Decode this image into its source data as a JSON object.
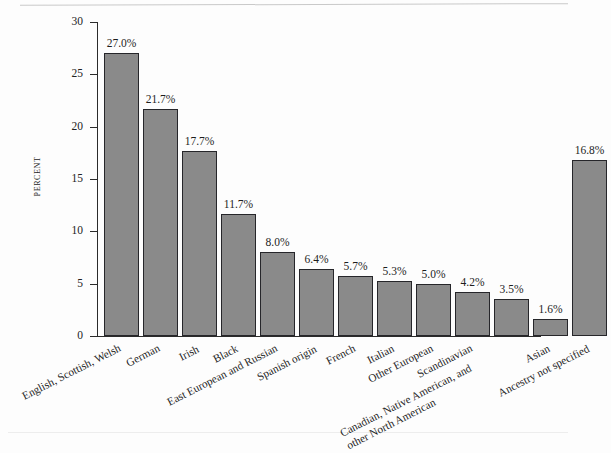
{
  "chart_data": {
    "type": "bar",
    "title": "",
    "xlabel": "",
    "ylabel": "PERCENT",
    "ylim": [
      0,
      30
    ],
    "yticks": [
      0,
      5,
      10,
      15,
      20,
      25,
      30
    ],
    "ytick_labels": [
      "0",
      "5",
      "10",
      "15",
      "20",
      "25",
      "30"
    ],
    "grid": false,
    "legend": null,
    "bar_color": "#8a8a8a",
    "bar_edge_color": "#26262a",
    "background_color": "#fdfdfd",
    "categories": [
      "English, Scottish, Welsh",
      "German",
      "Irish",
      "Black",
      "East European and Russian",
      "Spanish origin",
      "French",
      "Italian",
      "Other European",
      "Scandinavian",
      "Canadian, Native American, and other North American",
      "Asian",
      "Ancestry not specified"
    ],
    "values": [
      27.0,
      21.7,
      17.7,
      11.7,
      8.0,
      6.4,
      5.7,
      5.3,
      5.0,
      4.2,
      3.5,
      1.6,
      16.8
    ],
    "data_labels": [
      "27.0%",
      "21.7%",
      "17.7%",
      "11.7%",
      "8.0%",
      "6.4%",
      "5.7%",
      "5.3%",
      "5.0%",
      "4.2%",
      "3.5%",
      "1.6%",
      "16.8%"
    ]
  }
}
